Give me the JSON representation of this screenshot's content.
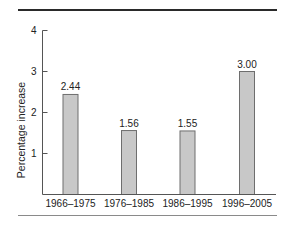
{
  "chart_data": {
    "type": "bar",
    "title": "",
    "xlabel": "",
    "ylabel": "Percentage increase",
    "categories": [
      "1966–1975",
      "1976–1985",
      "1986–1995",
      "1996–2005"
    ],
    "values": [
      2.44,
      1.56,
      1.55,
      3.0
    ],
    "value_labels": [
      "2.44",
      "1.56",
      "1.55",
      "3.00"
    ],
    "ylim": [
      0,
      4
    ],
    "yticks": [
      1,
      2,
      3,
      4
    ],
    "ytick_labels": [
      "1",
      "2",
      "3",
      "4"
    ],
    "grid": false,
    "legend": null,
    "colors": {
      "bar_fill": "#c8c8c8",
      "bar_stroke": "#6e6e6e",
      "axis": "#555555"
    }
  }
}
